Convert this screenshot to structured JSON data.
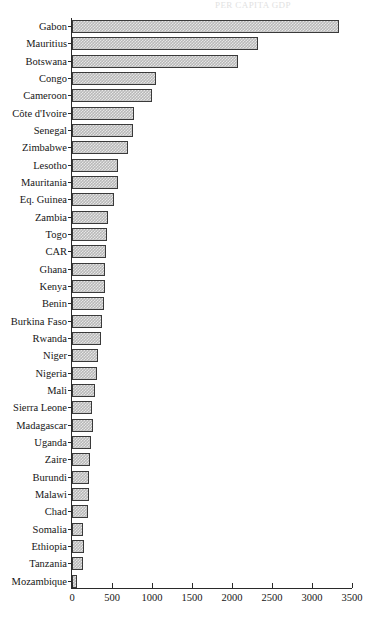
{
  "page": {
    "title_fragment": "PER CAPITA GDP"
  },
  "chart_data": {
    "type": "bar",
    "orientation": "horizontal",
    "title": "",
    "subtitle": "",
    "xlabel": "",
    "ylabel": "",
    "xlim": [
      0,
      3500
    ],
    "x_ticks": [
      0,
      500,
      1000,
      1500,
      2000,
      2500,
      3000,
      3500
    ],
    "x_tick_labels": [
      "0",
      "500",
      "1000",
      "1500",
      "2000",
      "2500",
      "3000",
      "3500"
    ],
    "grid": false,
    "legend": null,
    "bar_fill": "#b9b9b9",
    "bar_pattern": "checkerboard-halftone",
    "bar_border": "#3a3a3a",
    "categories": [
      "Gabon",
      "Mauritius",
      "Botswana",
      "Congo",
      "Cameroon",
      "Côte d'Ivoire",
      "Senegal",
      "Zimbabwe",
      "Lesotho",
      "Mauritania",
      "Eq. Guinea",
      "Zambia",
      "Togo",
      "CAR",
      "Ghana",
      "Kenya",
      "Benin",
      "Burkina Faso",
      "Rwanda",
      "Niger",
      "Nigeria",
      "Mali",
      "Sierra Leone",
      "Madagascar",
      "Uganda",
      "Zaire",
      "Burundi",
      "Malawi",
      "Chad",
      "Somalia",
      "Ethiopia",
      "Tanzania",
      "Mozambique"
    ],
    "values": [
      3340,
      2320,
      2070,
      1055,
      1000,
      780,
      760,
      700,
      570,
      580,
      520,
      450,
      435,
      428,
      412,
      418,
      406,
      375,
      360,
      330,
      310,
      290,
      255,
      268,
      235,
      228,
      218,
      214,
      205,
      143,
      152,
      143,
      68
    ]
  }
}
